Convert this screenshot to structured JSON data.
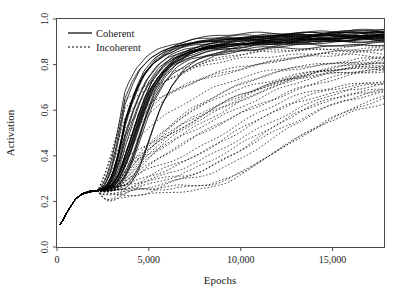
{
  "chart_data": {
    "type": "line",
    "title": "",
    "xlabel": "Epochs",
    "ylabel": "Activation",
    "xlim": [
      0,
      17800
    ],
    "ylim": [
      0.0,
      1.0
    ],
    "grid": false,
    "legend_position": "top-left",
    "xticks": [
      0,
      5000,
      10000,
      15000
    ],
    "xtick_labels": [
      "0",
      "5,000",
      "10,000",
      "15,000"
    ],
    "yticks": [
      0.0,
      0.2,
      0.4,
      0.6,
      0.8,
      1.0
    ],
    "ytick_labels": [
      "0.0",
      "0.2",
      "0.4",
      "0.6",
      "0.8",
      "1.0"
    ],
    "legend": [
      {
        "label": "Coherent",
        "style": "solid"
      },
      {
        "label": "Incoherent",
        "style": "dashed"
      }
    ],
    "series_groups": [
      {
        "name": "Coherent",
        "style": "solid",
        "count": 30,
        "description": "Solid black trajectories rising from ~0.10 through a ~0.25 shoulder near 1500-3000 epochs, then sigmoidally climbing between 3000 and 7000 epochs to an asymptote of about 0.90-0.95.",
        "x": [
          200,
          600,
          1000,
          1400,
          1800,
          2200,
          2600,
          3000,
          3400,
          3800,
          4200,
          4600,
          5000,
          5600,
          6200,
          7000,
          8000,
          9500,
          11000,
          13000,
          15000,
          17800
        ],
        "band_low": [
          0.1,
          0.16,
          0.21,
          0.235,
          0.245,
          0.248,
          0.25,
          0.258,
          0.285,
          0.34,
          0.43,
          0.53,
          0.62,
          0.71,
          0.77,
          0.815,
          0.845,
          0.865,
          0.878,
          0.888,
          0.895,
          0.9
        ],
        "band_high": [
          0.11,
          0.185,
          0.235,
          0.252,
          0.258,
          0.262,
          0.272,
          0.32,
          0.42,
          0.54,
          0.65,
          0.73,
          0.79,
          0.84,
          0.868,
          0.89,
          0.906,
          0.918,
          0.926,
          0.934,
          0.94,
          0.946
        ],
        "final_range": [
          0.88,
          0.95
        ]
      },
      {
        "name": "Incoherent",
        "style": "dashed",
        "count": 30,
        "description": "Dotted/dashed black trajectories sharing the same ~0.10 start and ~0.25 shoulder, but breaking away later and far more variably; rises are staggered from about 4000 to 14000 epochs and final values fan out between roughly 0.65 and 0.90.",
        "x": [
          200,
          600,
          1000,
          1400,
          1800,
          2200,
          2600,
          3000,
          3600,
          4200,
          5000,
          6000,
          7000,
          8000,
          9500,
          11000,
          12500,
          14000,
          16000,
          17800
        ],
        "band_low": [
          0.1,
          0.16,
          0.21,
          0.233,
          0.242,
          0.245,
          0.246,
          0.248,
          0.25,
          0.252,
          0.248,
          0.25,
          0.27,
          0.31,
          0.39,
          0.47,
          0.545,
          0.6,
          0.645,
          0.665
        ],
        "band_high": [
          0.11,
          0.185,
          0.235,
          0.25,
          0.256,
          0.26,
          0.268,
          0.295,
          0.36,
          0.44,
          0.545,
          0.65,
          0.725,
          0.775,
          0.822,
          0.85,
          0.868,
          0.88,
          0.89,
          0.896
        ],
        "final_range": [
          0.65,
          0.9
        ]
      }
    ]
  },
  "axes": {
    "x_title": "Epochs",
    "y_title": "Activation"
  }
}
